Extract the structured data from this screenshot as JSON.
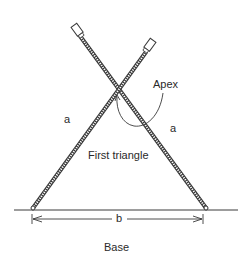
{
  "diagram": {
    "labels": {
      "apex": "Apex",
      "side_left": "a",
      "side_right": "a",
      "inner": "First triangle",
      "base_dimension": "b",
      "base": "Base"
    },
    "colors": {
      "line": "#3a3a3a",
      "rod_fill": "#ffffff",
      "background": "#ffffff"
    }
  }
}
